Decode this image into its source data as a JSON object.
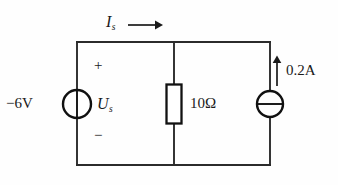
{
  "figure": {
    "background_color": "#fefefe",
    "line_color": "#2b2b2b"
  },
  "labels": {
    "source_value": "−6V",
    "source_symbol": "U",
    "source_symbol_subscript": "s",
    "polarity_plus": "+",
    "polarity_minus": "−",
    "resistor_value": "10Ω",
    "current_value": "0.2A",
    "branch_current_symbol": "I",
    "branch_current_subscript": "s"
  },
  "components": [
    {
      "name": "voltage-source",
      "type": "independent-voltage-source",
      "value": "−6V",
      "symbol_label": "Us",
      "polarity_top": "+",
      "polarity_bottom": "−",
      "position": {
        "cx": 77,
        "cy": 104,
        "r": 14
      }
    },
    {
      "name": "resistor",
      "type": "resistor",
      "value": "10Ω",
      "position": {
        "cx": 174,
        "cy": 104,
        "w": 15,
        "h": 39
      }
    },
    {
      "name": "current-source",
      "type": "independent-current-source",
      "value": "0.2A",
      "direction": "up",
      "position": {
        "cx": 270,
        "cy": 104,
        "r": 13
      }
    }
  ],
  "annotations": [
    {
      "name": "branch-current-arrow",
      "label": "Is",
      "direction": "right",
      "from_x": 128,
      "to_x": 161,
      "y": 25
    },
    {
      "name": "current-direction-arrow",
      "label": "0.2A",
      "direction": "up",
      "x": 277,
      "from_y": 86,
      "to_y": 57
    }
  ],
  "nodes": {
    "top_wire_y": 42,
    "bottom_wire_y": 165,
    "left_rail_x": 77,
    "middle_rail_x": 174,
    "right_rail_x": 270
  }
}
